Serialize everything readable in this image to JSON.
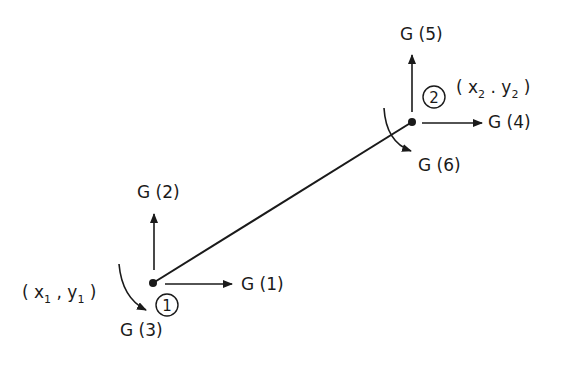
{
  "diagram": {
    "type": "beam-element-degrees-of-freedom",
    "colors": {
      "ink": "#1a1a1a",
      "background": "#ffffff"
    },
    "element": {
      "from_node": 1,
      "to_node": 2
    },
    "nodes": [
      {
        "id": 1,
        "number_label": "1",
        "coords_label": {
          "open": "( x",
          "sub1": "1",
          "mid": " ,  y",
          "sub2": "1",
          "close": " )"
        },
        "dofs": {
          "x": "G (1)",
          "y": "G (2)",
          "rotation": "G (3)"
        }
      },
      {
        "id": 2,
        "number_label": "2",
        "coords_label": {
          "open": "( x",
          "sub1": "2",
          "mid": " . y",
          "sub2": "2",
          "close": " )"
        },
        "dofs": {
          "x": "G (4)",
          "y": "G (5)",
          "rotation": "G (6)"
        }
      }
    ]
  }
}
